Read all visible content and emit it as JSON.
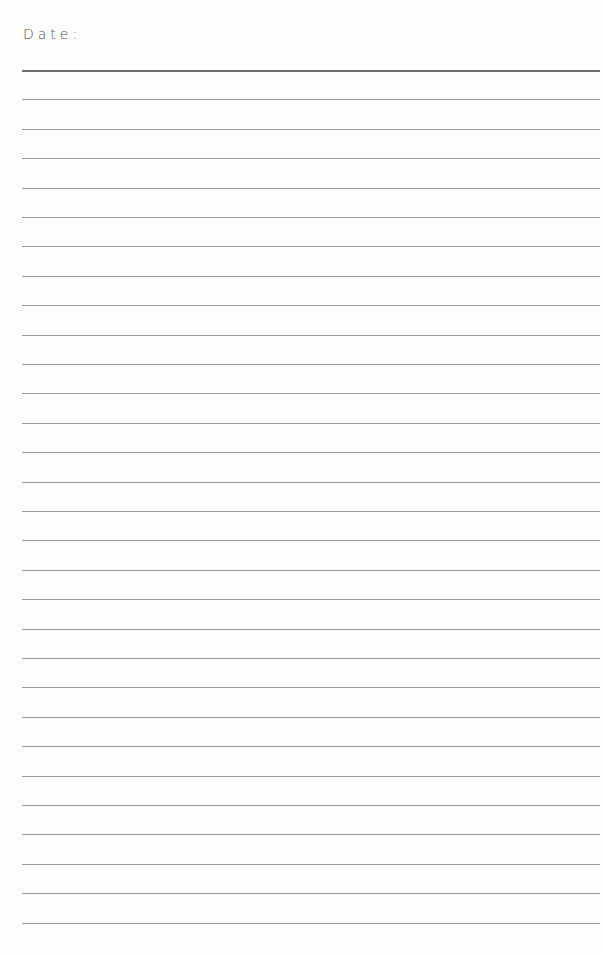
{
  "page": {
    "date_label": "Date:",
    "ruled_lines": {
      "count": 30,
      "first_y": 70,
      "spacing": 29.4,
      "color": "#9a9a9a",
      "first_line_color": "#6e6e6e"
    }
  }
}
